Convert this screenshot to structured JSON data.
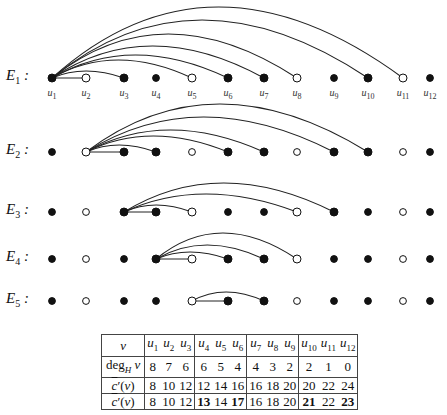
{
  "rows": [
    {
      "label": "E",
      "sub": "1",
      "y": 78,
      "hub": 1,
      "line": [
        2
      ],
      "arcs": [
        [
          3,
          71
        ],
        [
          5,
          60
        ],
        [
          6,
          55
        ],
        [
          7,
          46
        ],
        [
          8,
          34
        ],
        [
          10,
          20
        ],
        [
          11,
          7
        ]
      ],
      "open": [
        2,
        5,
        8,
        11
      ]
    },
    {
      "label": "E",
      "sub": "2",
      "y": 152,
      "hub": 2,
      "line": [
        3
      ],
      "arcs": [
        [
          4,
          145
        ],
        [
          6,
          136
        ],
        [
          7,
          130
        ],
        [
          9,
          117
        ],
        [
          10,
          104
        ]
      ],
      "open": [
        2,
        5,
        8,
        11
      ]
    },
    {
      "label": "E",
      "sub": "3",
      "y": 212,
      "hub": 3,
      "line": [
        4
      ],
      "arcs": [
        [
          5,
          205
        ],
        [
          8,
          194
        ],
        [
          9,
          183
        ]
      ],
      "open": [
        2,
        5,
        8,
        11
      ]
    },
    {
      "label": "E",
      "sub": "4",
      "y": 259,
      "hub": 4,
      "line": [
        5
      ],
      "arcs": [
        [
          6,
          252
        ],
        [
          7,
          245
        ],
        [
          8,
          233
        ]
      ],
      "open": [
        2,
        5,
        8,
        11
      ]
    },
    {
      "label": "E",
      "sub": "5",
      "y": 301,
      "hub": 5,
      "line": [
        6
      ],
      "arcs": [
        [
          7,
          292
        ]
      ],
      "open": [
        2,
        5,
        8,
        11
      ]
    }
  ],
  "node_x": [
    52,
    86,
    124,
    156,
    192,
    228,
    264,
    297,
    334,
    368,
    403,
    430
  ],
  "node_labels": [
    "u1",
    "u2",
    "u3",
    "u4",
    "u5",
    "u6",
    "u7",
    "u8",
    "u9",
    "u10",
    "u11",
    "u12"
  ],
  "table": {
    "header": {
      "label": "v",
      "cells": [
        "u1",
        "u2",
        "u3",
        "u4",
        "u5",
        "u6",
        "u7",
        "u8",
        "u9",
        "u10",
        "u11",
        "u12"
      ]
    },
    "rows": [
      {
        "label": "deg_H v",
        "cells": [
          "8",
          "7",
          "6",
          "6",
          "5",
          "4",
          "4",
          "3",
          "2",
          "2",
          "1",
          "0"
        ],
        "bold": []
      },
      {
        "label": "c̄′(v)",
        "cells": [
          "8",
          "10",
          "12",
          "12",
          "14",
          "16",
          "16",
          "18",
          "20",
          "20",
          "22",
          "24"
        ],
        "bold": []
      },
      {
        "label": "c̄′(v)",
        "cells": [
          "8",
          "10",
          "12",
          "13",
          "14",
          "17",
          "16",
          "18",
          "20",
          "21",
          "22",
          "23"
        ],
        "bold": [
          3,
          5,
          9,
          11
        ]
      }
    ]
  }
}
